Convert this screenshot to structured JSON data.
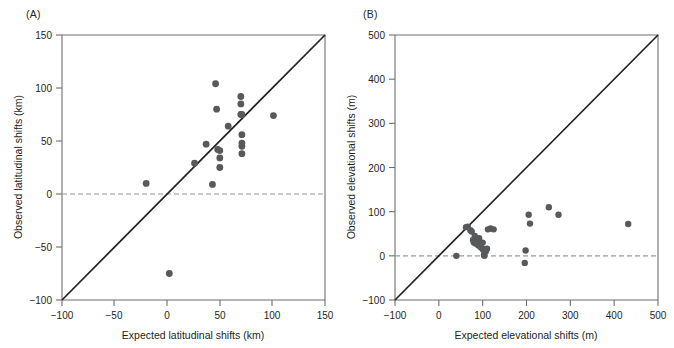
{
  "figure": {
    "width": 674,
    "height": 348,
    "background": "#ffffff",
    "marker_color": "#58595b",
    "line_color": "#231f20",
    "axis_color": "#6d6e71",
    "zero_line_color": "#9a9a9a"
  },
  "panels": [
    {
      "label": "(A)",
      "name": "panel-a",
      "xlabel": "Expected latitudinal shifts (km)",
      "ylabel": "Observed latitudinal shifts (km)",
      "xticks": [
        "−100",
        "−50",
        "0",
        "50",
        "100",
        "150"
      ],
      "yticks": [
        "150",
        "100",
        "50",
        "0",
        "−50",
        "−100"
      ]
    },
    {
      "label": "(B)",
      "name": "panel-b",
      "xlabel": "Expected elevational shifts (m)",
      "ylabel": "Observed elevational shifts (m)",
      "xticks": [
        "−100",
        "0",
        "100",
        "200",
        "300",
        "400",
        "500"
      ],
      "yticks": [
        "500",
        "400",
        "300",
        "200",
        "100",
        "0",
        "−100"
      ]
    }
  ],
  "chart_data": [
    {
      "type": "scatter",
      "panel": "(A)",
      "title": "",
      "xlabel": "Expected latitudinal shifts (km)",
      "ylabel": "Observed latitudinal shifts (km)",
      "xlim": [
        -100,
        150
      ],
      "ylim": [
        -100,
        150
      ],
      "xticks": [
        -100,
        -50,
        0,
        50,
        100,
        150
      ],
      "yticks": [
        -100,
        -50,
        0,
        50,
        100,
        150
      ],
      "grid": false,
      "legend": "none",
      "annotations": [
        {
          "kind": "line",
          "desc": "1:1 identity line",
          "style": "solid",
          "from": [
            -100,
            -100
          ],
          "to": [
            150,
            150
          ]
        },
        {
          "kind": "line",
          "desc": "zero reference",
          "style": "dashed",
          "from": [
            -100,
            0
          ],
          "to": [
            150,
            0
          ]
        }
      ],
      "points": [
        [
          -20,
          10
        ],
        [
          2,
          -75
        ],
        [
          26,
          29
        ],
        [
          37,
          47
        ],
        [
          43,
          9
        ],
        [
          46,
          104
        ],
        [
          47,
          80
        ],
        [
          48,
          42
        ],
        [
          50,
          41
        ],
        [
          50,
          34
        ],
        [
          50,
          25
        ],
        [
          58,
          64
        ],
        [
          70,
          92
        ],
        [
          70,
          85
        ],
        [
          70,
          75
        ],
        [
          71,
          75
        ],
        [
          71,
          56
        ],
        [
          71,
          48
        ],
        [
          71,
          45
        ],
        [
          71,
          38
        ],
        [
          101,
          74
        ]
      ]
    },
    {
      "type": "scatter",
      "panel": "(B)",
      "title": "",
      "xlabel": "Expected elevational shifts (m)",
      "ylabel": "Observed elevational shifts (m)",
      "xlim": [
        -100,
        500
      ],
      "ylim": [
        -100,
        500
      ],
      "xticks": [
        -100,
        0,
        100,
        200,
        300,
        400,
        500
      ],
      "yticks": [
        -100,
        0,
        100,
        200,
        300,
        400,
        500
      ],
      "grid": false,
      "legend": "none",
      "annotations": [
        {
          "kind": "line",
          "desc": "1:1 identity line",
          "style": "solid",
          "from": [
            -100,
            -100
          ],
          "to": [
            500,
            500
          ]
        },
        {
          "kind": "line",
          "desc": "zero reference",
          "style": "dashed",
          "from": [
            -100,
            0
          ],
          "to": [
            500,
            0
          ]
        }
      ],
      "points": [
        [
          40,
          0
        ],
        [
          62,
          65
        ],
        [
          66,
          66
        ],
        [
          72,
          58
        ],
        [
          75,
          55
        ],
        [
          78,
          36
        ],
        [
          80,
          30
        ],
        [
          82,
          45
        ],
        [
          84,
          28
        ],
        [
          88,
          32
        ],
        [
          90,
          24
        ],
        [
          92,
          40
        ],
        [
          95,
          20
        ],
        [
          98,
          18
        ],
        [
          100,
          30
        ],
        [
          101,
          14
        ],
        [
          103,
          2
        ],
        [
          104,
          0
        ],
        [
          105,
          12
        ],
        [
          107,
          10
        ],
        [
          110,
          16
        ],
        [
          112,
          60
        ],
        [
          118,
          62
        ],
        [
          125,
          60
        ],
        [
          196,
          -16
        ],
        [
          198,
          12
        ],
        [
          205,
          93
        ],
        [
          208,
          73
        ],
        [
          251,
          110
        ],
        [
          273,
          93
        ],
        [
          432,
          72
        ]
      ]
    }
  ]
}
